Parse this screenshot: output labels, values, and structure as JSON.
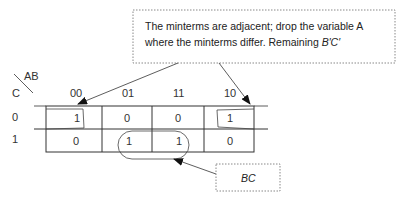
{
  "kmap": {
    "corner": {
      "top_var": "AB",
      "left_var": "C"
    },
    "columns": [
      "00",
      "01",
      "11",
      "10"
    ],
    "rows": [
      {
        "label": "0",
        "cells": [
          "1",
          "0",
          "0",
          "1"
        ]
      },
      {
        "label": "1",
        "cells": [
          "0",
          "1",
          "1",
          "0"
        ]
      }
    ]
  },
  "callouts": {
    "top": {
      "line1": "The minterms are adjacent; drop the variable A",
      "line2_prefix": "where the minterms differ. Remaining ",
      "line2_term": "B′C′"
    },
    "bottom": {
      "text": "BC"
    }
  },
  "colors": {
    "line": "#333333",
    "border_dotted": "#888888",
    "text": "#222222"
  }
}
